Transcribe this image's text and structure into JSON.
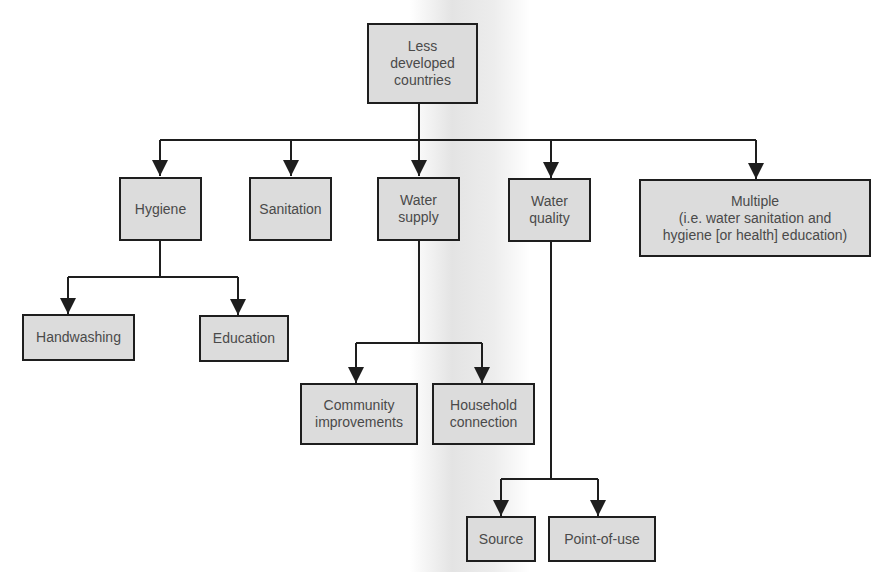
{
  "diagram": {
    "root": {
      "label": "Less\ndeveloped\ncountries"
    },
    "level1": [
      {
        "id": "hygiene",
        "label": "Hygiene"
      },
      {
        "id": "sanitation",
        "label": "Sanitation"
      },
      {
        "id": "water-supply",
        "label": "Water\nsupply"
      },
      {
        "id": "water-quality",
        "label": "Water\nquality"
      },
      {
        "id": "multiple",
        "label": "Multiple\n(i.e. water sanitation and\nhygiene [or health] education)"
      }
    ],
    "hygiene_children": [
      {
        "id": "handwashing",
        "label": "Handwashing"
      },
      {
        "id": "education",
        "label": "Education"
      }
    ],
    "water_supply_children": [
      {
        "id": "community-improvements",
        "label": "Community\nimprovements"
      },
      {
        "id": "household-connection",
        "label": "Household\nconnection"
      }
    ],
    "water_quality_children": [
      {
        "id": "source",
        "label": "Source"
      },
      {
        "id": "point-of-use",
        "label": "Point-of-use"
      }
    ],
    "colors": {
      "box_fill": "#dcdcdc",
      "border": "#1e1e1e",
      "text": "#4a4a4a",
      "line": "#1e1e1e"
    }
  }
}
